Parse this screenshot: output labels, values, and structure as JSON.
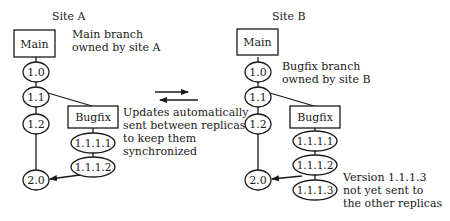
{
  "diagram": {
    "type": "version-tree-replication",
    "sync_note": [
      "Updates automatically",
      "sent between replicas",
      "to keep them",
      "synchronized"
    ],
    "sites": [
      {
        "title": "Site A",
        "main_label": "Main",
        "note": [
          "Main branch",
          "owned by site A"
        ],
        "main_versions": [
          "1.0",
          "1.1",
          "1.2",
          "2.0"
        ],
        "branch_label": "Bugfix",
        "branch_versions": [
          "1.1.1.1",
          "1.1.1.2"
        ]
      },
      {
        "title": "Site B",
        "main_label": "Main",
        "note": [
          "Bugfix branch",
          "owned by site B"
        ],
        "main_versions": [
          "1.0",
          "1.1",
          "1.2",
          "2.0"
        ],
        "branch_label": "Bugfix",
        "branch_versions": [
          "1.1.1.1",
          "1.1.1.2",
          "1.1.1.3"
        ],
        "pending_note": [
          "Version 1.1.1.3",
          "not yet sent to",
          "the other replicas"
        ]
      }
    ],
    "colors": {
      "line": "#1a1a1a",
      "background": "#ffffff"
    }
  }
}
